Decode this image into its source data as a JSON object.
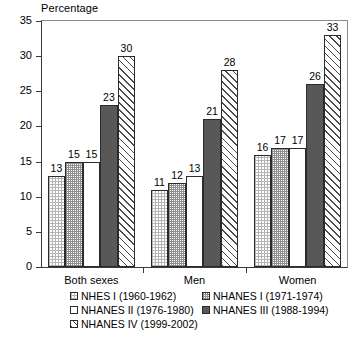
{
  "chart_data": {
    "type": "bar",
    "title": "Percentage",
    "xlabel": "",
    "ylabel": "Percentage",
    "ylim": [
      0,
      35
    ],
    "yticks": [
      0,
      5,
      10,
      15,
      20,
      25,
      30,
      35
    ],
    "grid": false,
    "legend_position": "bottom",
    "categories": [
      "Both sexes",
      "Men",
      "Women"
    ],
    "series": [
      {
        "name": "NHES I (1960-1962)",
        "values": [
          13,
          11,
          16
        ],
        "pattern": "fine-dot-grid",
        "color": "#ffffff"
      },
      {
        "name": "NHANES I (1971-1974)",
        "values": [
          15,
          12,
          17
        ],
        "pattern": "grey-checker",
        "color": "#ffffff"
      },
      {
        "name": "NHANES II (1976-1980)",
        "values": [
          15,
          13,
          17
        ],
        "pattern": "solid-white",
        "color": "#ffffff"
      },
      {
        "name": "NHANES III (1988-1994)",
        "values": [
          23,
          21,
          26
        ],
        "pattern": "solid-dark-grey",
        "color": "#585858"
      },
      {
        "name": "NHANES IV (1999-2002)",
        "values": [
          30,
          28,
          33
        ],
        "pattern": "diagonal-hatch",
        "color": "#ffffff"
      }
    ],
    "data_labels": [
      [
        13,
        15,
        15,
        23,
        30
      ],
      [
        11,
        12,
        13,
        21,
        28
      ],
      [
        16,
        17,
        17,
        26,
        33
      ]
    ]
  },
  "legend": {
    "rows": [
      [
        {
          "label": "NHES I (1960-1962)",
          "swatch": "fine-dot-grid"
        },
        {
          "label": "NHANES I (1971-1974)",
          "swatch": "grey-checker"
        }
      ],
      [
        {
          "label": "NHANES II (1976-1980)",
          "swatch": "solid-white"
        },
        {
          "label": "NHANES III (1988-1994)",
          "swatch": "solid-dark-grey"
        }
      ],
      [
        {
          "label": "NHANES IV (1999-2002)",
          "swatch": "diagonal-hatch"
        }
      ]
    ]
  }
}
